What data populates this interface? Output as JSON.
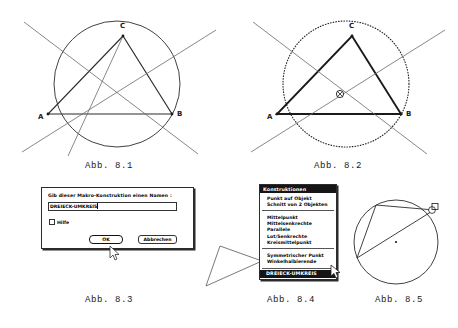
{
  "figures": [
    {
      "id": "fig-8-1",
      "caption": "Abb. 8.1",
      "vertex_labels": [
        "A",
        "B",
        "C"
      ],
      "description": "Dreieck mit Umkreis und Mittelsenkrechten"
    },
    {
      "id": "fig-8-2",
      "caption": "Abb. 8.2",
      "vertex_labels": [
        "A",
        "B",
        "C"
      ],
      "description": "Dreieck mit gestricheltem Umkreis und Umkreismittelpunkt"
    },
    {
      "id": "fig-8-3",
      "caption": "Abb. 8.3",
      "description": "Dialogfenster Makro-Namen"
    },
    {
      "id": "fig-8-4",
      "caption": "Abb. 8.4",
      "description": "Menue Konstruktionen"
    },
    {
      "id": "fig-8-5",
      "caption": "Abb. 8.5",
      "description": "Kreis mit Thalesdreieck und rechtem Winkel"
    }
  ],
  "dialog": {
    "prompt": "Gib dieser Makro-Konstruktion einen Namen :",
    "input_value": "DREIECK-UMKREIS",
    "input_placeholder": "",
    "checkbox_label": "Hilfe",
    "checkbox_checked": false,
    "ok_label": "OK",
    "cancel_label": "Abbrechen"
  },
  "menu": {
    "title": "Konstruktionen",
    "group_one": [
      "Punkt auf Objekt",
      "Schnitt von 2 Objekten"
    ],
    "group_two": [
      "Mittelpunkt",
      "Mittelsenkrechte",
      "Parallele",
      "Lot/Senkrechte",
      "Kreismittelpunkt"
    ],
    "group_three": [
      "Symmetrischer Punkt",
      "Winkelhalbierende"
    ],
    "selected_item": "DREIECK-UMKREIS"
  },
  "colors": {
    "ink": "#1a1a1a",
    "paper": "#ffffff",
    "highlight_bg": "#151515",
    "highlight_fg": "#ffffff"
  }
}
